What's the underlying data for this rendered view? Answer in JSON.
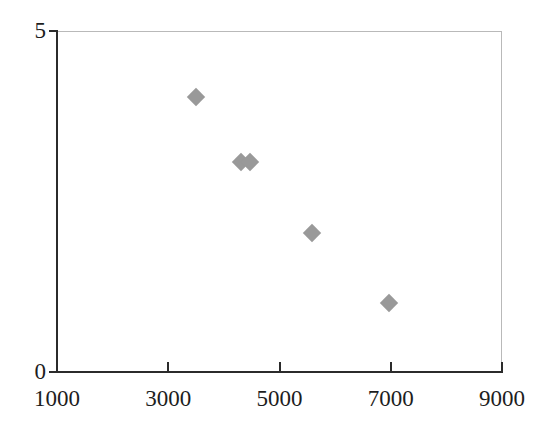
{
  "chart_data": {
    "type": "scatter",
    "title": "",
    "subtitle": "",
    "xlabel": "",
    "ylabel": "",
    "xlim": [
      1000,
      9000
    ],
    "ylim": [
      0,
      5
    ],
    "grid": false,
    "legend": null,
    "marker": {
      "shape": "diamond",
      "color": "#999999",
      "size": 13
    },
    "xticks": [
      {
        "value": 1000,
        "label": "1000"
      },
      {
        "value": 3000,
        "label": "3000"
      },
      {
        "value": 5000,
        "label": "5000"
      },
      {
        "value": 7000,
        "label": "7000"
      },
      {
        "value": 9000,
        "label": "9000"
      }
    ],
    "yticks": [
      {
        "value": 0,
        "label": "0"
      },
      {
        "value": 5,
        "label": "5"
      }
    ],
    "points": [
      {
        "x": 3500,
        "y": 4.03
      },
      {
        "x": 4310,
        "y": 3.08
      },
      {
        "x": 4470,
        "y": 3.08
      },
      {
        "x": 5585,
        "y": 2.04
      },
      {
        "x": 6970,
        "y": 1.01
      }
    ],
    "colors": {
      "marker": "#999999",
      "axis": "#2b2b2b",
      "frame": "#b9b9b9",
      "text": "#1d1d1d",
      "background": "#ffffff"
    }
  }
}
